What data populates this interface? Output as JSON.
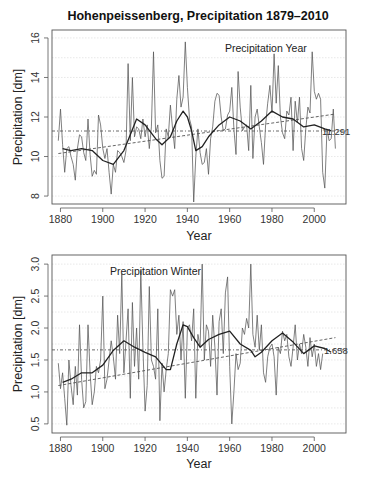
{
  "figure": {
    "title": "Hohenpeissenberg, Precipitation 1879–2010"
  },
  "chart_data": [
    {
      "type": "line",
      "panel_label": "Precipitation Year",
      "title": "Hohenpeissenberg, Precipitation 1879–2010",
      "xlabel": "Year",
      "ylabel": "Precipitation [dm]",
      "xlim": [
        1876,
        2015
      ],
      "ylim": [
        7.8,
        16.2
      ],
      "xticks": [
        1880,
        1900,
        1920,
        1940,
        1960,
        1980,
        2000
      ],
      "yticks": [
        8,
        10,
        12,
        14,
        16
      ],
      "grid": "horizontal dotted",
      "mean_value": 11.291,
      "mean_label": "11.291",
      "trend_line": {
        "x": [
          1879,
          2010
        ],
        "y": [
          10.15,
          12.15
        ]
      },
      "series": [
        {
          "name": "annual",
          "x": [
            1879,
            1880,
            1881,
            1882,
            1883,
            1884,
            1885,
            1886,
            1887,
            1888,
            1889,
            1890,
            1891,
            1892,
            1893,
            1894,
            1895,
            1896,
            1897,
            1898,
            1899,
            1900,
            1901,
            1902,
            1903,
            1904,
            1905,
            1906,
            1907,
            1908,
            1909,
            1910,
            1911,
            1912,
            1913,
            1914,
            1915,
            1916,
            1917,
            1918,
            1919,
            1920,
            1921,
            1922,
            1923,
            1924,
            1925,
            1926,
            1927,
            1928,
            1929,
            1930,
            1931,
            1932,
            1933,
            1934,
            1935,
            1936,
            1937,
            1938,
            1939,
            1940,
            1941,
            1942,
            1943,
            1944,
            1945,
            1946,
            1947,
            1948,
            1949,
            1950,
            1951,
            1952,
            1953,
            1954,
            1955,
            1956,
            1957,
            1958,
            1959,
            1960,
            1961,
            1962,
            1963,
            1964,
            1965,
            1966,
            1967,
            1968,
            1969,
            1970,
            1971,
            1972,
            1973,
            1974,
            1975,
            1976,
            1977,
            1978,
            1979,
            1980,
            1981,
            1982,
            1983,
            1984,
            1985,
            1986,
            1987,
            1988,
            1989,
            1990,
            1991,
            1992,
            1993,
            1994,
            1995,
            1996,
            1997,
            1998,
            1999,
            2000,
            2001,
            2002,
            2003,
            2004,
            2005,
            2006,
            2007,
            2008,
            2009,
            2010
          ],
          "values": [
            10.8,
            12.4,
            10.6,
            9.2,
            10.4,
            10.5,
            10.0,
            9.6,
            8.8,
            10.4,
            11.1,
            11.0,
            10.2,
            9.8,
            11.9,
            10.1,
            9.0,
            9.3,
            9.1,
            12.1,
            11.6,
            10.4,
            9.9,
            10.4,
            9.2,
            8.1,
            9.6,
            9.2,
            10.3,
            10.2,
            10.0,
            9.7,
            10.3,
            14.7,
            10.8,
            14.0,
            11.0,
            11.5,
            11.4,
            10.9,
            11.9,
            11.0,
            11.6,
            10.4,
            11.5,
            15.3,
            11.2,
            11.6,
            9.8,
            8.9,
            9.0,
            11.4,
            11.0,
            12.6,
            11.4,
            10.4,
            12.9,
            14.1,
            12.5,
            13.0,
            15.8,
            13.5,
            11.9,
            11.5,
            7.7,
            10.0,
            11.4,
            10.2,
            9.6,
            9.7,
            10.4,
            9.1,
            10.9,
            11.5,
            12.8,
            13.2,
            13.1,
            12.0,
            11.3,
            11.4,
            12.1,
            12.3,
            13.5,
            11.4,
            10.1,
            14.3,
            12.5,
            11.3,
            11.5,
            11.6,
            10.3,
            13.6,
            9.9,
            12.0,
            12.4,
            11.5,
            10.7,
            9.6,
            11.6,
            12.7,
            13.6,
            12.2,
            15.2,
            12.7,
            14.6,
            12.0,
            11.2,
            10.9,
            12.3,
            12.1,
            13.0,
            10.3,
            12.8,
            11.7,
            13.0,
            10.4,
            9.8,
            11.4,
            12.5,
            12.2,
            15.3,
            13.3,
            12.9,
            13.2,
            12.9,
            9.2,
            8.4,
            11.4,
            10.8,
            10.9,
            12.4,
            10.4
          ]
        },
        {
          "name": "smoothed",
          "x": [
            1881,
            1885,
            1890,
            1895,
            1900,
            1905,
            1910,
            1913,
            1916,
            1920,
            1925,
            1928,
            1932,
            1935,
            1938,
            1940,
            1942,
            1944,
            1947,
            1950,
            1955,
            1960,
            1965,
            1970,
            1975,
            1980,
            1985,
            1990,
            1995,
            2000,
            2005,
            2008
          ],
          "values": [
            10.4,
            10.3,
            10.4,
            10.3,
            9.8,
            9.6,
            10.3,
            11.1,
            11.9,
            11.6,
            10.9,
            10.6,
            11.0,
            11.8,
            12.3,
            12.0,
            11.3,
            10.3,
            10.5,
            11.0,
            11.6,
            12.0,
            11.8,
            11.4,
            11.8,
            12.3,
            12.0,
            11.9,
            11.5,
            11.6,
            11.4,
            11.3
          ]
        }
      ]
    },
    {
      "type": "line",
      "panel_label": "Precipitation Winter",
      "xlabel": "Year",
      "ylabel": "Precipitation [dm]",
      "xlim": [
        1876,
        2015
      ],
      "ylim": [
        0.42,
        3.08
      ],
      "xticks": [
        1880,
        1900,
        1920,
        1940,
        1960,
        1980,
        2000
      ],
      "yticks": [
        0.5,
        1.0,
        1.5,
        2.0,
        2.5,
        3.0
      ],
      "ytick_labels": [
        "0.5",
        "1.0",
        "1.5",
        "2.0",
        "2.5",
        "3.0"
      ],
      "grid": "horizontal dotted",
      "mean_value": 1.658,
      "mean_label": "1.658",
      "trend_line": {
        "x": [
          1879,
          2010
        ],
        "y": [
          1.1,
          1.85
        ]
      },
      "series": [
        {
          "name": "winter",
          "x": [
            1879,
            1880,
            1881,
            1882,
            1883,
            1884,
            1885,
            1886,
            1887,
            1888,
            1889,
            1890,
            1891,
            1892,
            1893,
            1894,
            1895,
            1896,
            1897,
            1898,
            1899,
            1900,
            1901,
            1902,
            1903,
            1904,
            1905,
            1906,
            1907,
            1908,
            1909,
            1910,
            1911,
            1912,
            1913,
            1914,
            1915,
            1916,
            1917,
            1918,
            1919,
            1920,
            1921,
            1922,
            1923,
            1924,
            1925,
            1926,
            1927,
            1928,
            1929,
            1930,
            1931,
            1932,
            1933,
            1934,
            1935,
            1936,
            1937,
            1938,
            1939,
            1940,
            1941,
            1942,
            1943,
            1944,
            1945,
            1946,
            1947,
            1948,
            1949,
            1950,
            1951,
            1952,
            1953,
            1954,
            1955,
            1956,
            1957,
            1958,
            1959,
            1960,
            1961,
            1962,
            1963,
            1964,
            1965,
            1966,
            1967,
            1968,
            1969,
            1970,
            1971,
            1972,
            1973,
            1974,
            1975,
            1976,
            1977,
            1978,
            1979,
            1980,
            1981,
            1982,
            1983,
            1984,
            1985,
            1986,
            1987,
            1988,
            1989,
            1990,
            1991,
            1992,
            1993,
            1994,
            1995,
            1996,
            1997,
            1998,
            1999,
            2000,
            2001,
            2002,
            2003,
            2004,
            2005,
            2006,
            2007,
            2008,
            2009,
            2010
          ],
          "values": [
            1.45,
            1.05,
            1.3,
            0.9,
            0.48,
            1.5,
            1.1,
            0.8,
            1.4,
            0.95,
            2.05,
            1.2,
            0.75,
            0.85,
            2.05,
            1.3,
            0.8,
            1.0,
            1.4,
            1.3,
            1.5,
            2.5,
            1.05,
            1.2,
            1.5,
            1.8,
            1.55,
            1.2,
            2.2,
            1.6,
            2.85,
            1.3,
            1.8,
            2.3,
            0.9,
            2.4,
            1.4,
            2.0,
            1.2,
            2.9,
            1.7,
            0.7,
            1.1,
            2.65,
            1.5,
            1.4,
            1.2,
            2.3,
            0.55,
            1.45,
            1.0,
            1.35,
            1.6,
            2.6,
            2.5,
            2.6,
            1.9,
            2.2,
            1.5,
            2.1,
            0.9,
            2.0,
            2.05,
            1.8,
            2.3,
            0.9,
            1.9,
            1.7,
            3.0,
            1.5,
            2.05,
            1.95,
            1.4,
            2.2,
            1.7,
            0.95,
            2.1,
            2.3,
            1.6,
            2.55,
            2.8,
            1.4,
            0.5,
            1.0,
            1.6,
            1.35,
            1.45,
            2.0,
            1.9,
            2.15,
            2.0,
            3.0,
            1.9,
            1.7,
            2.2,
            1.65,
            2.05,
            1.3,
            1.15,
            1.55,
            1.7,
            1.75,
            1.55,
            0.95,
            1.7,
            1.6,
            1.95,
            1.8,
            1.9,
            1.55,
            1.4,
            1.7,
            2.05,
            1.5,
            1.75,
            1.6,
            1.9,
            1.7,
            1.4,
            1.85,
            1.55,
            1.75,
            1.4,
            1.6,
            1.35,
            1.6
          ]
        },
        {
          "name": "smoothed",
          "x": [
            1881,
            1885,
            1890,
            1895,
            1900,
            1905,
            1910,
            1915,
            1920,
            1925,
            1930,
            1932,
            1935,
            1938,
            1940,
            1943,
            1946,
            1950,
            1955,
            1960,
            1965,
            1970,
            1972,
            1975,
            1980,
            1985,
            1990,
            1995,
            2000,
            2005,
            2008
          ],
          "values": [
            1.15,
            1.2,
            1.3,
            1.3,
            1.42,
            1.65,
            1.8,
            1.7,
            1.62,
            1.55,
            1.35,
            1.35,
            1.75,
            2.05,
            2.02,
            1.85,
            1.7,
            1.82,
            1.9,
            1.95,
            1.75,
            1.65,
            1.55,
            1.62,
            1.8,
            1.92,
            1.78,
            1.6,
            1.72,
            1.68,
            1.62
          ]
        }
      ]
    }
  ]
}
